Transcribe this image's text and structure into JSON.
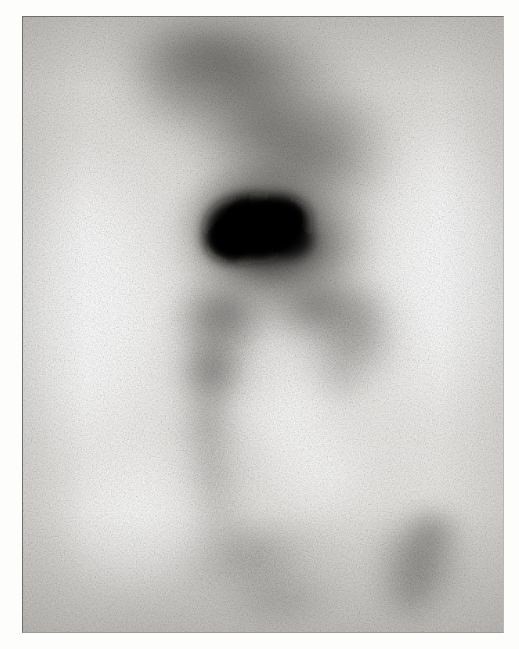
{
  "image": {
    "modality_name": "scintigraphy-scan",
    "view_description": "planar nuclear medicine scintigram, grayscale",
    "frame": {
      "plate_left": 22,
      "plate_top": 16,
      "plate_width": 482,
      "plate_height": 617,
      "border_color": "#6e6e6c",
      "page_background": "#fdfdfc"
    },
    "palette": {
      "background_gray": "#e9e8e6",
      "bright_white": "#fbfbfa",
      "mid_gray": "#9a9894",
      "dark_gray": "#5a5855",
      "hotspot_black": "#0b0b0a",
      "grain_tint": "#6d6b67"
    },
    "regions": [
      {
        "name": "upper-diagonal-uptake-band",
        "label": "Upper diagonal activity band",
        "intensity": "moderate-high",
        "cx_pct": 44,
        "cy_pct": 14,
        "rx_pct": 26,
        "ry_pct": 24
      },
      {
        "name": "central-focal-hotspot",
        "label": "Central intense focal uptake",
        "intensity": "maximum",
        "cx_pct": 53,
        "cy_pct": 37,
        "rx_pct": 11,
        "ry_pct": 7
      },
      {
        "name": "hotspot-halo",
        "label": "Periphotspot gradient halo",
        "intensity": "high",
        "cx_pct": 53,
        "cy_pct": 37,
        "rx_pct": 23,
        "ry_pct": 18
      },
      {
        "name": "left-descending-branch",
        "label": "Left descending activity branch",
        "intensity": "moderate",
        "cx_pct": 40,
        "cy_pct": 62,
        "rx_pct": 11,
        "ry_pct": 18
      },
      {
        "name": "right-descending-branch",
        "label": "Right descending activity branch",
        "intensity": "moderate-low",
        "cx_pct": 67,
        "cy_pct": 56,
        "rx_pct": 13,
        "ry_pct": 13
      },
      {
        "name": "lower-right-mottled-focus",
        "label": "Lower right mottled uptake focus",
        "intensity": "moderate",
        "cx_pct": 82,
        "cy_pct": 89,
        "rx_pct": 12,
        "ry_pct": 12
      },
      {
        "name": "lower-central-faint-trail",
        "label": "Lower central faint activity trail",
        "intensity": "low",
        "cx_pct": 50,
        "cy_pct": 92,
        "rx_pct": 16,
        "ry_pct": 11
      },
      {
        "name": "left-photopenic-field",
        "label": "Left photopenic (cold) field",
        "intensity": "none",
        "cx_pct": 13,
        "cy_pct": 47,
        "rx_pct": 16,
        "ry_pct": 26
      },
      {
        "name": "right-photopenic-field",
        "label": "Right photopenic (cold) field",
        "intensity": "none",
        "cx_pct": 88,
        "cy_pct": 40,
        "rx_pct": 15,
        "ry_pct": 25
      }
    ],
    "grain": {
      "base_frequency": 0.72,
      "octaves": 4,
      "seed": 17,
      "opacity": 0.95
    },
    "speckle": {
      "base_frequency": 1.45,
      "octaves": 2,
      "seed": 44,
      "opacity": 0.62
    }
  }
}
